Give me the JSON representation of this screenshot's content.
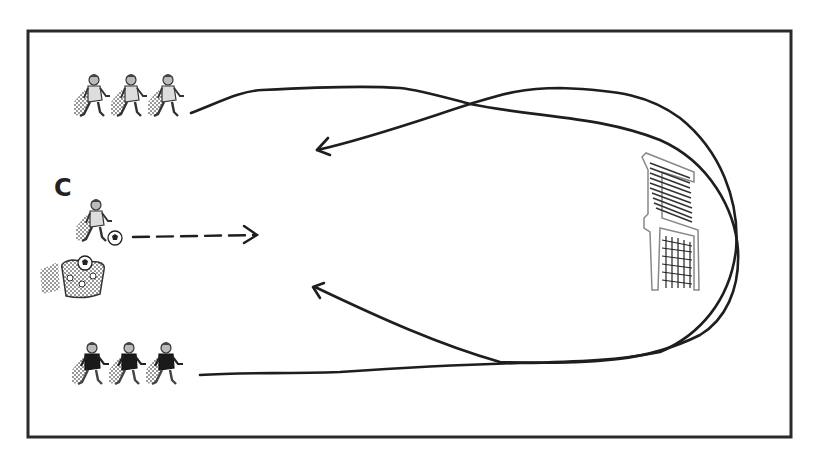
{
  "diagram": {
    "type": "soccer-drill",
    "background": "#ffffff",
    "frame": {
      "x": 28,
      "y": 30,
      "width": 764,
      "height": 408,
      "stroke": "#2a2a2a",
      "stroke_width": 3
    },
    "coach": {
      "label": "C",
      "has_ball": true
    },
    "ball_bag": {
      "present": true
    },
    "groups": [
      {
        "name": "top-group",
        "players": 3,
        "jersey": "light"
      },
      {
        "name": "bottom-group",
        "players": 3,
        "jersey": "dark"
      }
    ],
    "goal": {
      "present": true,
      "orientation": "side-view"
    },
    "paths": [
      {
        "name": "top-run",
        "style": "solid",
        "description": "from top group looping around goal, ending with arrow at left-center bottom"
      },
      {
        "name": "bottom-run",
        "style": "solid",
        "description": "from bottom group looping around goal, ending with arrow at left-center top"
      },
      {
        "name": "coach-pass",
        "style": "dashed",
        "description": "pass from coach toward center"
      }
    ],
    "line_color": "#1e1e1e"
  }
}
